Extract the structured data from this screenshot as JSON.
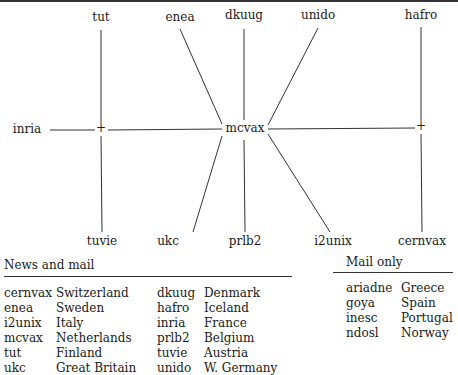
{
  "diagram": {
    "hub": "mcvax",
    "nodes": {
      "tut": "tut",
      "enea": "enea",
      "dkuug": "dkuug",
      "unido": "unido",
      "hafro": "hafro",
      "inria": "inria",
      "mcvax": "mcvax",
      "tuvie": "tuvie",
      "ukc": "ukc",
      "prlb2": "prlb2",
      "i2unix": "i2unix",
      "cernvax": "cernvax"
    },
    "junction_symbol": "+"
  },
  "news_and_mail": {
    "title": "News and mail",
    "left": [
      {
        "site": "cernvax",
        "country": "Switzerland"
      },
      {
        "site": "enea",
        "country": "Sweden"
      },
      {
        "site": "i2unix",
        "country": "Italy"
      },
      {
        "site": "mcvax",
        "country": "Netherlands"
      },
      {
        "site": "tut",
        "country": "Finland"
      },
      {
        "site": "ukc",
        "country": "Great Britain"
      }
    ],
    "right": [
      {
        "site": "dkuug",
        "country": "Denmark"
      },
      {
        "site": "hafro",
        "country": "Iceland"
      },
      {
        "site": "inria",
        "country": "France"
      },
      {
        "site": "prlb2",
        "country": "Belgium"
      },
      {
        "site": "tuvie",
        "country": "Austria"
      },
      {
        "site": "unido",
        "country": "W. Germany"
      }
    ]
  },
  "mail_only": {
    "title": "Mail only",
    "rows": [
      {
        "site": "ariadne",
        "country": "Greece"
      },
      {
        "site": "goya",
        "country": "Spain"
      },
      {
        "site": "inesc",
        "country": "Portugal"
      },
      {
        "site": "ndosl",
        "country": "Norway"
      }
    ]
  }
}
